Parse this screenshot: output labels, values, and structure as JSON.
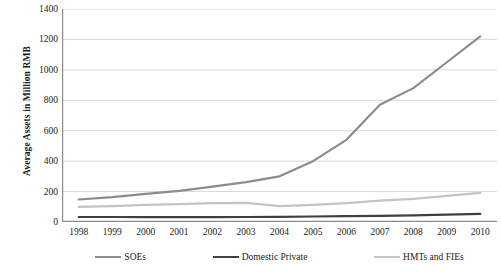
{
  "chart_data": {
    "type": "line",
    "title": "",
    "xlabel": "",
    "ylabel": "Average Assets in Million RMB",
    "categories": [
      "1998",
      "1999",
      "2000",
      "2001",
      "2002",
      "2003",
      "2004",
      "2005",
      "2006",
      "2007",
      "2008",
      "2009",
      "2010"
    ],
    "x": [
      1998,
      1999,
      2000,
      2001,
      2002,
      2003,
      2004,
      2005,
      2006,
      2007,
      2008,
      2009,
      2010
    ],
    "ylim": [
      0,
      1400
    ],
    "yticks": [
      0,
      200,
      400,
      600,
      800,
      1000,
      1200,
      1400
    ],
    "grid": true,
    "legend_position": "bottom",
    "series": [
      {
        "name": "SOEs",
        "color": "#8c8c8c",
        "values": [
          148,
          163,
          185,
          205,
          232,
          262,
          300,
          400,
          540,
          770,
          880,
          1050,
          1220
        ]
      },
      {
        "name": "Domestic Private",
        "color": "#404040",
        "values": [
          33,
          33,
          32,
          32,
          32,
          33,
          34,
          36,
          38,
          40,
          44,
          48,
          53
        ]
      },
      {
        "name": "HMTs and FIEs",
        "color": "#c4c4c4",
        "values": [
          100,
          105,
          112,
          118,
          124,
          126,
          104,
          112,
          124,
          140,
          152,
          172,
          192
        ]
      }
    ]
  },
  "axes": {
    "y_title": "Average Assets in Million RMB",
    "y_tick_labels": [
      "1400",
      "1200",
      "1000",
      "800",
      "600",
      "400",
      "200",
      "0"
    ],
    "x_tick_labels": [
      "1998",
      "1999",
      "2000",
      "2001",
      "2002",
      "2003",
      "2004",
      "2005",
      "2006",
      "2007",
      "2008",
      "2009",
      "2010"
    ]
  },
  "legend": {
    "items": [
      {
        "label": "SOEs",
        "color": "#8c8c8c"
      },
      {
        "label": "Domestic Private",
        "color": "#404040"
      },
      {
        "label": "HMTs and FIEs",
        "color": "#c4c4c4"
      }
    ]
  },
  "colors": {
    "grid": "#d9d9d9",
    "axis": "#8a8a8a",
    "text": "#1a1a1a",
    "background": "#ffffff"
  }
}
